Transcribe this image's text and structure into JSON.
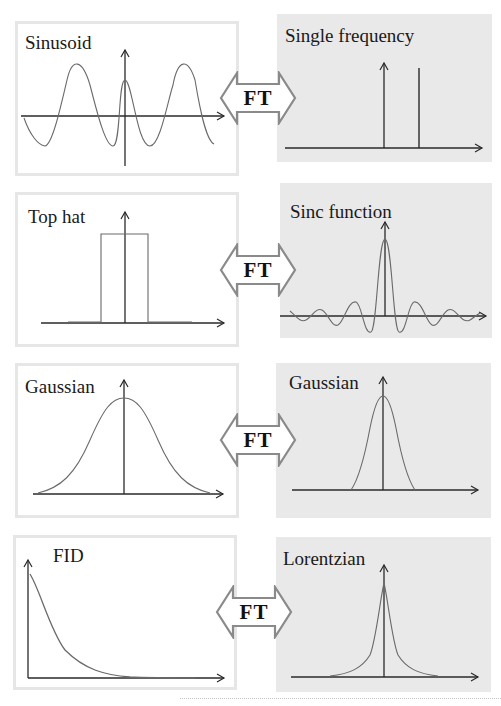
{
  "colors": {
    "time_panel_bg": "#ffffff",
    "time_panel_border": "#e6e6e6",
    "freq_panel_bg": "#e9e9e9",
    "axis": "#2a2a2a",
    "curve": "#6a6a6a",
    "arrow_fill": "#ffffff",
    "arrow_stroke": "#8a8a8a"
  },
  "operator_label": "FT",
  "rows": [
    {
      "time": {
        "label": "Sinusoid"
      },
      "freq": {
        "label": "Single frequency"
      },
      "operator": "FT"
    },
    {
      "time": {
        "label": "Top hat"
      },
      "freq": {
        "label": "Sinc function"
      },
      "operator": "FT"
    },
    {
      "time": {
        "label": "Gaussian"
      },
      "freq": {
        "label": "Gaussian"
      },
      "operator": "FT"
    },
    {
      "time": {
        "label": "FID"
      },
      "freq": {
        "label": "Lorentzian"
      },
      "operator": "FT"
    }
  ]
}
